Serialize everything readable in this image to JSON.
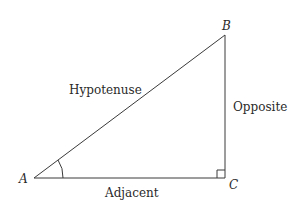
{
  "diagram": {
    "vertices": {
      "A": {
        "label": "A",
        "x": 34,
        "y": 178
      },
      "B": {
        "label": "B",
        "x": 225,
        "y": 35
      },
      "C": {
        "label": "C",
        "x": 225,
        "y": 178
      }
    },
    "sides": {
      "hypotenuse": "Hypotenuse",
      "opposite": "Opposite",
      "adjacent": "Adjacent"
    },
    "markers": {
      "right_angle_at": "C",
      "angle_arc_at": "A"
    },
    "colors": {
      "line": "#3a3a3a",
      "text": "#2a2a2a",
      "background": "#ffffff"
    }
  }
}
